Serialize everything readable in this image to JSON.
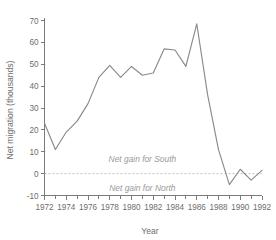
{
  "chart_data": {
    "type": "line",
    "title": "",
    "xlabel": "Year",
    "ylabel": "Net migration (thousands)",
    "xlim": [
      1972,
      1992
    ],
    "ylim": [
      -10,
      70
    ],
    "grid": false,
    "legend": "none",
    "x": [
      1972,
      1973,
      1974,
      1975,
      1976,
      1977,
      1978,
      1979,
      1980,
      1981,
      1982,
      1983,
      1984,
      1985,
      1986,
      1987,
      1988,
      1989,
      1990,
      1991,
      1992
    ],
    "values": [
      23,
      11,
      19,
      24,
      32,
      44,
      49.5,
      44,
      49,
      45,
      46,
      57,
      56.5,
      49,
      68.5,
      36,
      11,
      -5,
      2,
      -3,
      1.5
    ],
    "series": [
      {
        "name": "Net migration",
        "values": [
          23,
          11,
          19,
          24,
          32,
          44,
          49.5,
          44,
          49,
          45,
          46,
          57,
          56.5,
          49,
          68.5,
          36,
          11,
          -5,
          2,
          -3,
          1.5
        ]
      }
    ],
    "xticks": [
      1972,
      1974,
      1976,
      1978,
      1980,
      1982,
      1984,
      1986,
      1988,
      1990,
      1992
    ],
    "xtick_labels": [
      "1972",
      "1974",
      "1976",
      "1978",
      "1980",
      "1982",
      "1984",
      "1986",
      "1988",
      "1990",
      "1992"
    ],
    "xticks_minor": [
      1973,
      1975,
      1977,
      1979,
      1981,
      1983,
      1985,
      1987,
      1989,
      1991
    ],
    "yticks": [
      -10,
      0,
      10,
      20,
      30,
      40,
      50,
      60,
      70
    ],
    "ytick_labels": [
      "-10",
      "0",
      "10",
      "20",
      "30",
      "40",
      "50",
      "60",
      "70"
    ],
    "reference_line": {
      "value": 0,
      "style": "dashed",
      "color": "#b0b0b0"
    },
    "annotations": [
      {
        "text": "Net gain for South",
        "x": 1981,
        "y": 6.5
      },
      {
        "text": "Net gain for North",
        "x": 1981,
        "y": -6.5
      }
    ],
    "colors": {
      "line": "#8a8a8a",
      "axis": "#6e6e6e",
      "text": "#6e6e6e",
      "annotation": "#9a9a9a",
      "reference": "#b0b0b0",
      "background": "#ffffff"
    }
  }
}
